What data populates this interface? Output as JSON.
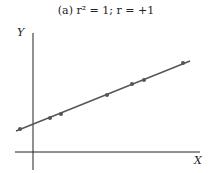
{
  "chart_data": {
    "type": "scatter",
    "title": "(a)  r² = 1; r = +1",
    "xlabel": "X",
    "ylabel": "Y",
    "grid": false,
    "fit_line": {
      "from": [
        16,
        131
      ],
      "to": [
        190,
        61
      ]
    },
    "points_px": [
      [
        20,
        129
      ],
      [
        50,
        118
      ],
      [
        61,
        114
      ],
      [
        107,
        95
      ],
      [
        132,
        84
      ],
      [
        144,
        80
      ],
      [
        183,
        63
      ]
    ],
    "axes_px": {
      "y_axis_x": 33,
      "y_axis_top": 33,
      "y_axis_bottom": 170,
      "x_axis_y": 152,
      "x_axis_left": 15,
      "x_axis_right": 200
    }
  },
  "colors": {
    "axis": "#222222",
    "line": "#555555",
    "point": "#555555"
  }
}
